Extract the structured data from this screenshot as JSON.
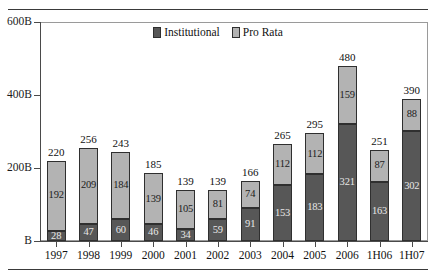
{
  "chart_data": {
    "type": "bar",
    "title": "",
    "subtitle": "",
    "xlabel": "",
    "ylabel": "",
    "stacked": true,
    "grid": false,
    "legend_position": "top-center",
    "ylim": [
      0,
      600
    ],
    "yticks": [
      0,
      200,
      400,
      600
    ],
    "ytick_labels": [
      "B",
      "200B",
      "400B",
      "600B"
    ],
    "categories": [
      "1997",
      "1998",
      "1999",
      "2000",
      "2001",
      "2002",
      "2003",
      "2004",
      "2005",
      "2006",
      "1H06",
      "1H07"
    ],
    "series": [
      {
        "name": "Institutional",
        "color": "#575757",
        "values": [
          28,
          47,
          60,
          46,
          34,
          59,
          91,
          153,
          183,
          321,
          163,
          302
        ]
      },
      {
        "name": "Pro Rata",
        "color": "#b3b3b3",
        "values": [
          192,
          209,
          184,
          139,
          105,
          81,
          74,
          112,
          112,
          159,
          87,
          88
        ]
      }
    ],
    "totals": [
      220,
      256,
      243,
      185,
      139,
      139,
      166,
      265,
      295,
      480,
      251,
      390
    ]
  },
  "legend": {
    "items": [
      {
        "label": "Institutional",
        "swatch": "institutional-swatch"
      },
      {
        "label": "Pro Rata",
        "swatch": "pro-rata-swatch"
      }
    ]
  }
}
